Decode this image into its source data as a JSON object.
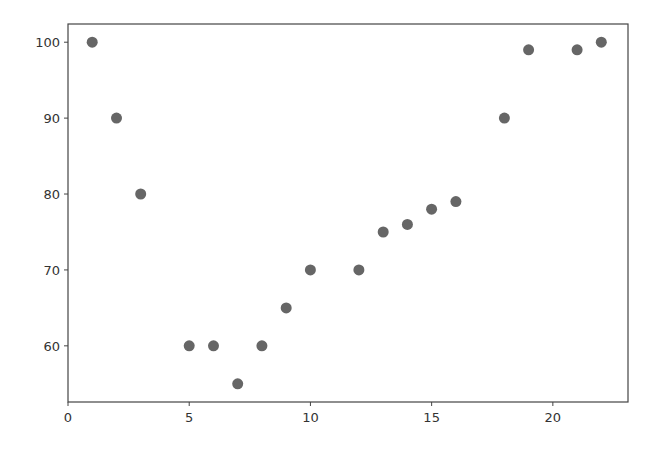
{
  "chart_data": {
    "type": "scatter",
    "title": "",
    "xlabel": "",
    "ylabel": "",
    "xlim": [
      0,
      23.1
    ],
    "ylim": [
      52.6,
      102.4
    ],
    "grid": false,
    "legend": null,
    "x_ticks": [
      0,
      5,
      10,
      15,
      20
    ],
    "y_ticks": [
      60,
      70,
      80,
      90,
      100
    ],
    "marker_color": "#666666",
    "series": [
      {
        "name": "data",
        "points": [
          {
            "x": 1,
            "y": 100
          },
          {
            "x": 2,
            "y": 90
          },
          {
            "x": 3,
            "y": 80
          },
          {
            "x": 5,
            "y": 60
          },
          {
            "x": 6,
            "y": 60
          },
          {
            "x": 7,
            "y": 55
          },
          {
            "x": 8,
            "y": 60
          },
          {
            "x": 9,
            "y": 65
          },
          {
            "x": 10,
            "y": 70
          },
          {
            "x": 12,
            "y": 70
          },
          {
            "x": 13,
            "y": 75
          },
          {
            "x": 14,
            "y": 76
          },
          {
            "x": 15,
            "y": 78
          },
          {
            "x": 16,
            "y": 79
          },
          {
            "x": 18,
            "y": 90
          },
          {
            "x": 19,
            "y": 99
          },
          {
            "x": 21,
            "y": 99
          },
          {
            "x": 22,
            "y": 100
          }
        ]
      }
    ]
  }
}
